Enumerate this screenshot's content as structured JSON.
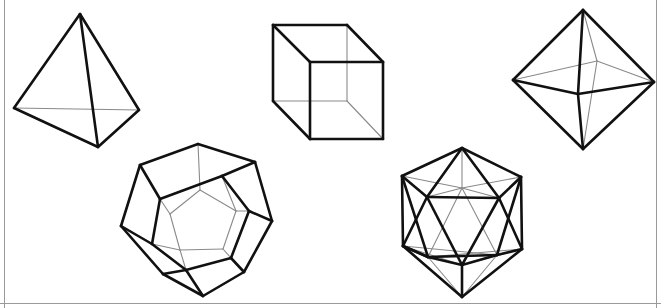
{
  "figure": {
    "background_color": "#ffffff",
    "visible_edge_color": "#111111",
    "hidden_edge_color": "#8a8a8a",
    "frame_color": "#9a9a9a",
    "width": 661,
    "height": 308
  },
  "frame": {
    "left_border": "M 4.5 0 L 4.5 308",
    "right_border": "M 656.5 0 L 656.5 308",
    "bottom_border": "M 0 303.5 L 661 303.5"
  },
  "solids": [
    {
      "name": "tetrahedron",
      "faces": 4,
      "vertices_count": 4,
      "edges_count": 6,
      "position": "top-left",
      "points": {
        "apex": [
          80,
          14
        ],
        "left": [
          14,
          108
        ],
        "right": [
          139,
          110
        ],
        "front": [
          98,
          147
        ]
      },
      "visible_edges": [
        "M 80 14 L 14 108",
        "M 80 14 L 139 110",
        "M 80 14 L 98 147",
        "M 14 108 L 98 147",
        "M 139 110 L 98 147"
      ],
      "hidden_edges": [
        "M 14 108 L 139 110"
      ]
    },
    {
      "name": "cube",
      "faces": 6,
      "vertices_count": 8,
      "edges_count": 12,
      "position": "top-center",
      "points": {
        "back_top_left": [
          273,
          25
        ],
        "back_top_right": [
          347,
          25
        ],
        "back_bottom_right": [
          347,
          101
        ],
        "back_bottom_left": [
          273,
          101
        ],
        "front_top_left": [
          310,
          62
        ],
        "front_top_right": [
          383,
          62
        ],
        "front_bottom_right": [
          383,
          139
        ],
        "front_bottom_left": [
          310,
          139
        ]
      },
      "visible_edges": [
        "M 273 25 L 347 25",
        "M 347 25 L 383 62",
        "M 273 25 L 310 62",
        "M 310 62 L 383 62",
        "M 383 62 L 383 139",
        "M 310 62 L 310 139",
        "M 310 139 L 383 139",
        "M 273 25 L 273 101",
        "M 273 101 L 310 139"
      ],
      "hidden_edges": [
        "M 347 25 L 347 101",
        "M 273 101 L 347 101",
        "M 347 101 L 383 139"
      ]
    },
    {
      "name": "octahedron",
      "faces": 8,
      "vertices_count": 6,
      "edges_count": 12,
      "position": "top-right",
      "points": {
        "top": [
          583,
          10
        ],
        "bottom": [
          583,
          149
        ],
        "left": [
          513,
          80
        ],
        "right": [
          654,
          82
        ],
        "front": [
          578,
          94
        ],
        "back": [
          597,
          61
        ]
      },
      "visible_edges": [
        "M 583 10 L 513 80",
        "M 583 10 L 654 82",
        "M 513 80 L 583 149",
        "M 654 82 L 583 149",
        "M 583 10 L 578 94",
        "M 578 94 L 583 149",
        "M 513 80 L 578 94",
        "M 578 94 L 654 82"
      ],
      "hidden_edges": [
        "M 583 10 L 597 61",
        "M 597 61 L 583 149",
        "M 513 80 L 597 61",
        "M 597 61 L 654 82"
      ]
    },
    {
      "name": "dodecahedron",
      "faces": 12,
      "vertices_count": 20,
      "edges_count": 30,
      "position": "bottom-left",
      "points": {
        "outer_top": [
          198,
          144
        ],
        "outer_upper_left": [
          140,
          165
        ],
        "outer_left": [
          121,
          226
        ],
        "outer_lower_left": [
          163,
          274
        ],
        "outer_bottom": [
          203,
          296
        ],
        "outer_lower_right": [
          244,
          272
        ],
        "outer_right": [
          272,
          221
        ],
        "outer_upper_right": [
          255,
          162
        ],
        "mid_upper_left": [
          160,
          199
        ],
        "mid_left": [
          152,
          244
        ],
        "mid_lower_left": [
          186,
          270
        ],
        "mid_lower_right": [
          231,
          258
        ],
        "mid_right": [
          249,
          211
        ],
        "mid_upper_right": [
          222,
          176
        ],
        "inner_top": [
          200,
          190
        ],
        "inner_upper_left": [
          170,
          214
        ],
        "inner_lower_left": [
          180,
          250
        ],
        "inner_lower_right": [
          223,
          249
        ],
        "inner_upper_right": [
          236,
          211
        ]
      },
      "visible_edges": [
        "M 198 144 L 140 165",
        "M 140 165 L 121 226",
        "M 121 226 L 163 274",
        "M 163 274 L 203 296",
        "M 203 296 L 244 272",
        "M 244 272 L 272 221",
        "M 272 221 L 255 162",
        "M 255 162 L 198 144",
        "M 140 165 L 160 199",
        "M 160 199 L 222 176",
        "M 222 176 L 255 162",
        "M 121 226 L 152 244",
        "M 152 244 L 160 199",
        "M 272 221 L 249 211",
        "M 249 211 L 222 176",
        "M 163 274 L 186 270",
        "M 186 270 L 152 244",
        "M 244 272 L 231 258",
        "M 231 258 L 249 211",
        "M 203 296 L 186 270",
        "M 186 270 L 231 258"
      ],
      "hidden_edges": [
        "M 198 144 L 200 190",
        "M 200 190 L 170 214",
        "M 170 214 L 180 250",
        "M 180 250 L 223 249",
        "M 223 249 L 236 211",
        "M 236 211 L 200 190",
        "M 160 199 L 170 214",
        "M 152 244 L 180 250",
        "M 186 270 L 180 250",
        "M 231 258 L 223 249",
        "M 249 211 L 236 211",
        "M 222 176 L 236 211"
      ]
    },
    {
      "name": "icosahedron",
      "faces": 20,
      "vertices_count": 12,
      "edges_count": 30,
      "position": "bottom-center-right",
      "points": {
        "top": [
          462,
          148
        ],
        "hex_upper_left": [
          402,
          176
        ],
        "hex_lower_left": [
          403,
          246
        ],
        "bottom": [
          462,
          297
        ],
        "hex_lower_right": [
          522,
          249
        ],
        "hex_upper_right": [
          521,
          177
        ],
        "upper_band_left": [
          427,
          197
        ],
        "upper_band_right": [
          499,
          198
        ],
        "upper_band_mid_back": [
          462,
          188
        ],
        "lower_band_left": [
          428,
          257
        ],
        "lower_band_right": [
          497,
          255
        ],
        "lower_band_mid_front": [
          462,
          265
        ]
      },
      "visible_edges": [
        "M 462 148 L 402 176",
        "M 402 176 L 403 246",
        "M 403 246 L 462 297",
        "M 462 297 L 522 249",
        "M 522 249 L 521 177",
        "M 521 177 L 462 148",
        "M 462 148 L 427 197",
        "M 462 148 L 499 198",
        "M 402 176 L 427 197",
        "M 521 177 L 499 198",
        "M 427 197 L 499 198",
        "M 427 197 L 462 265",
        "M 499 198 L 462 265",
        "M 403 246 L 428 257",
        "M 522 249 L 497 255",
        "M 428 257 L 497 255",
        "M 428 257 L 462 265",
        "M 497 255 L 462 265",
        "M 462 265 L 462 297",
        "M 403 246 L 427 197",
        "M 522 249 L 499 198",
        "M 428 257 L 403 246",
        "M 402 176 L 428 257",
        "M 521 177 L 497 255"
      ],
      "hidden_edges": [
        "M 462 148 L 462 188",
        "M 462 188 L 427 197",
        "M 462 188 L 499 198",
        "M 402 176 L 462 188",
        "M 521 177 L 462 188",
        "M 462 188 L 428 257",
        "M 462 188 L 497 255",
        "M 403 246 L 462 265",
        "M 522 249 L 462 265",
        "M 428 257 L 462 297",
        "M 497 255 L 462 297",
        "M 403 246 L 497 255",
        "M 522 249 L 428 257"
      ]
    }
  ]
}
